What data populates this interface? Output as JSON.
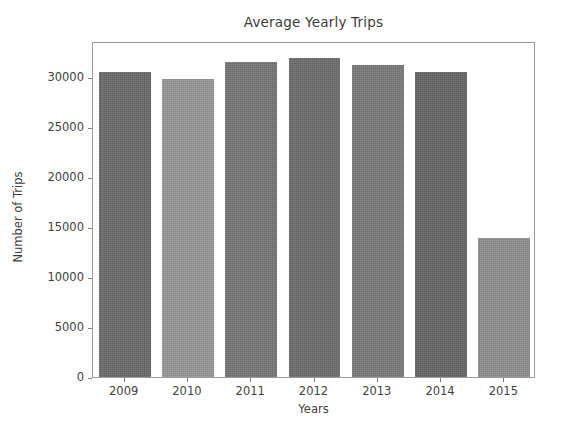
{
  "chart_data": {
    "type": "bar",
    "title": "Average Yearly Trips",
    "xlabel": "Years",
    "ylabel": "Number of Trips",
    "categories": [
      "2009",
      "2010",
      "2011",
      "2012",
      "2013",
      "2014",
      "2015"
    ],
    "values": [
      30500,
      29800,
      31500,
      31900,
      31200,
      30500,
      13900
    ],
    "ylim": [
      0,
      33600
    ],
    "yticks": [
      0,
      5000,
      10000,
      15000,
      20000,
      25000,
      30000
    ],
    "ytick_labels": [
      "0",
      "5000",
      "10000",
      "15000",
      "20000",
      "25000",
      "30000"
    ],
    "grid": false,
    "legend": null,
    "bar_colors": [
      "#6a6a6a",
      "#979797",
      "#767676",
      "#6d6d6d",
      "#797979",
      "#666666",
      "#8f8f8f"
    ]
  },
  "figure": {
    "background_color": "#ffffff",
    "axes_edge_color": "#9a9a9a",
    "tick_color": "#7d7d7d",
    "text_color": "#3f3f3f"
  }
}
